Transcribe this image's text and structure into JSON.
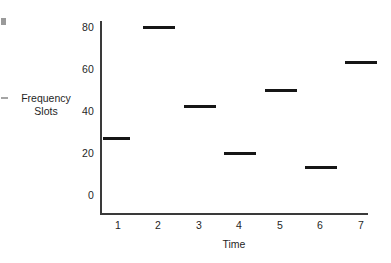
{
  "chart_data": {
    "type": "bar",
    "title": "",
    "subtitle": "",
    "xlabel": "Time",
    "ylabel": "Frequency Slots",
    "ylabel_lines": [
      "Frequency",
      "Slots"
    ],
    "categories": [
      "1",
      "2",
      "3",
      "4",
      "5",
      "6",
      "7"
    ],
    "values": [
      27,
      80,
      42,
      20,
      50,
      13,
      63
    ],
    "series": [
      {
        "name": "Frequency Slots",
        "values": [
          27,
          80,
          42,
          20,
          50,
          13,
          63
        ]
      }
    ],
    "xlim": [
      0.4,
      7.4
    ],
    "ylim": [
      0,
      84
    ],
    "ytick_labels": [
      "0",
      "20",
      "40",
      "60",
      "80"
    ],
    "ytick_values": [
      0,
      20,
      40,
      60,
      80
    ],
    "xtick_labels": [
      "1",
      "2",
      "3",
      "4",
      "5",
      "6",
      "7"
    ],
    "grid": false,
    "legend": false,
    "legend_position": "none",
    "bar_style": "horizontal-level-segment",
    "colors": {
      "bar": "#161616",
      "axis": "#3a3a3a",
      "text": "#1f1f1f",
      "background": "#ffffff"
    }
  },
  "axis": {
    "y_ticks": [
      {
        "label": "80",
        "value": 80
      },
      {
        "label": "60",
        "value": 60
      },
      {
        "label": "40",
        "value": 40
      },
      {
        "label": "20",
        "value": 20
      },
      {
        "label": "0",
        "value": 0
      }
    ],
    "x_ticks": [
      {
        "label": "1"
      },
      {
        "label": "2"
      },
      {
        "label": "3"
      },
      {
        "label": "4"
      },
      {
        "label": "5"
      },
      {
        "label": "6"
      },
      {
        "label": "7"
      }
    ]
  },
  "titles": {
    "x_axis": "Time",
    "y_axis_line1": "Frequency",
    "y_axis_line2": "Slots"
  }
}
